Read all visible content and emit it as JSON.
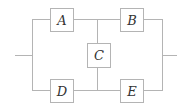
{
  "diagram": {
    "type": "reliability-network",
    "colors": {
      "line": "#b4b4b4",
      "box_fill": "#ffffff",
      "box_stroke": "#b4b4b4",
      "label": "#333333"
    },
    "components": [
      {
        "id": "A",
        "label": "A",
        "x": 50,
        "y": 8,
        "w": 23,
        "h": 23
      },
      {
        "id": "B",
        "label": "B",
        "x": 120,
        "y": 8,
        "w": 23,
        "h": 23
      },
      {
        "id": "C",
        "label": "C",
        "x": 87,
        "y": 43,
        "w": 23,
        "h": 24
      },
      {
        "id": "D",
        "label": "D",
        "x": 50,
        "y": 79,
        "w": 23,
        "h": 23
      },
      {
        "id": "E",
        "label": "E",
        "x": 120,
        "y": 79,
        "w": 23,
        "h": 23
      }
    ]
  }
}
